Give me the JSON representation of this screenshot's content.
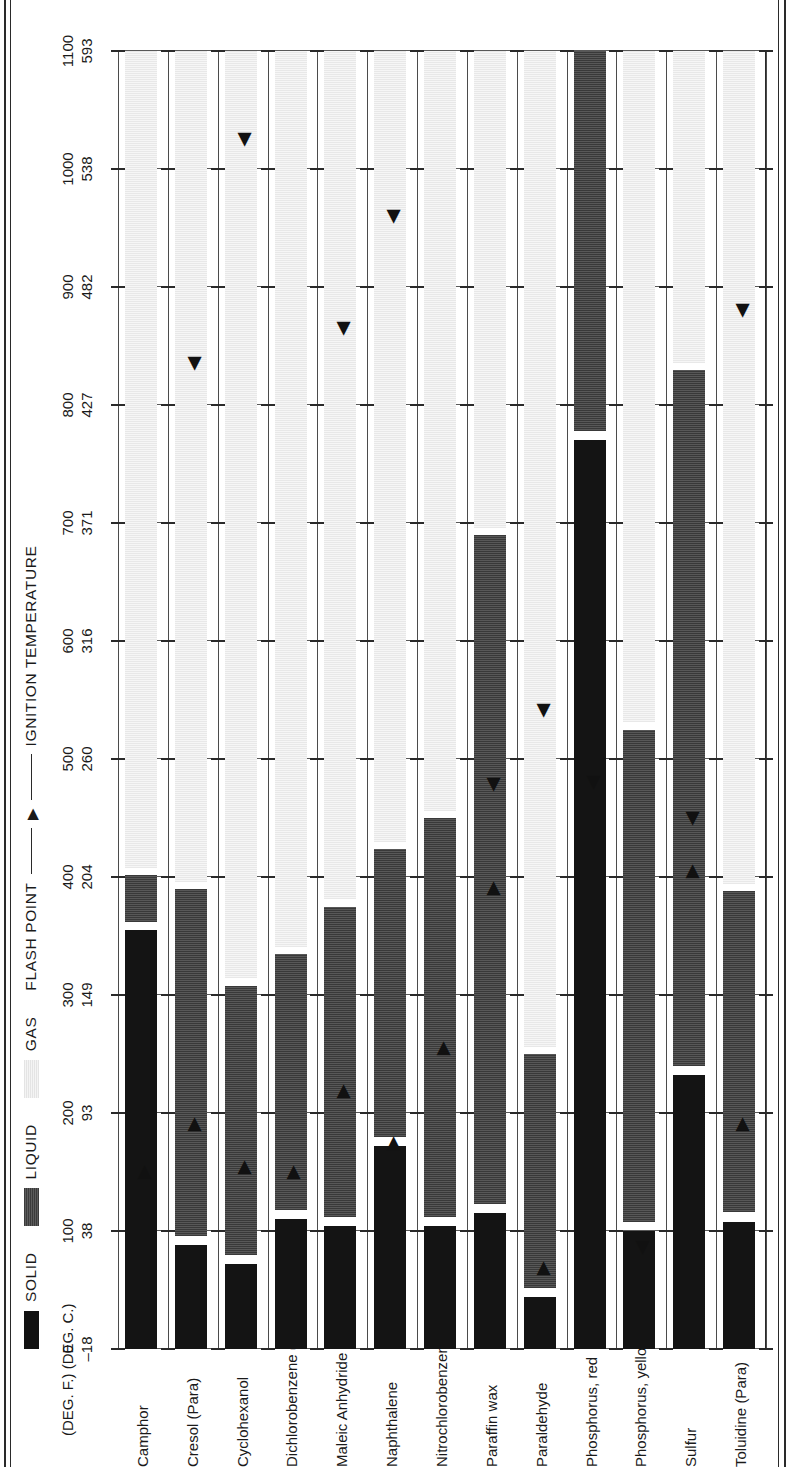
{
  "legend": {
    "items": [
      {
        "label": "SOLID",
        "swatch": "solid",
        "color": "#141414"
      },
      {
        "label": "LIQUID",
        "swatch": "liquid",
        "color": "#474747"
      },
      {
        "label": "GAS",
        "swatch": "gas",
        "color": "#efefef"
      }
    ],
    "flash_point_label": "FLASH POINT",
    "flash_point_marker": "▶",
    "ignition_label": "IGNITION TEMPERATURE",
    "ignition_marker": "◀"
  },
  "axis": {
    "unit_f": "(DEG. F.)",
    "unit_c": "(DEG. C.)",
    "ticks_f": [
      0,
      100,
      200,
      300,
      400,
      500,
      600,
      700,
      800,
      900,
      1000,
      1100
    ],
    "ticks_c": [
      -18,
      38,
      93,
      149,
      204,
      260,
      316,
      371,
      427,
      482,
      538,
      593
    ],
    "ticks_c_display": [
      "–18",
      "38",
      "93",
      "149",
      "204",
      "260",
      "316",
      "371",
      "427",
      "482",
      "538",
      "593"
    ],
    "min_f": 0,
    "max_f": 1100
  },
  "chart_data": {
    "type": "bar",
    "title": "",
    "xlabel": "",
    "ylabel": "",
    "xlim": [
      0,
      1100
    ],
    "grid": true,
    "legend_position": "top",
    "categories": [
      "Camphor",
      "Cresol (Para)",
      "Cyclohexanol",
      "Dichlorobenzene (Para)",
      "Maleic Anhydride",
      "Naphthalene",
      "Nitrochlorobenzene (Ortho)",
      "Paraffin wax",
      "Paraldehyde",
      "Phosphorus, red",
      "Phosphorus, yellow",
      "Sulfur",
      "Toluidine (Para)"
    ],
    "series": [
      {
        "name": "Camphor",
        "solid": [
          0,
          355
        ],
        "liquid": [
          362,
          402
        ],
        "gas": [
          408,
          1100
        ],
        "flash_point": 150,
        "ignition_temperature": null
      },
      {
        "name": "Cresol (Para)",
        "solid": [
          0,
          88
        ],
        "liquid": [
          96,
          390
        ],
        "gas": [
          396,
          1100
        ],
        "flash_point": 190,
        "ignition_temperature": 835
      },
      {
        "name": "Cyclohexanol",
        "solid": [
          0,
          72
        ],
        "liquid": [
          80,
          308
        ],
        "gas": [
          314,
          1100
        ],
        "flash_point": 154,
        "ignition_temperature": 1025
      },
      {
        "name": "Dichlorobenzene (Para)",
        "solid": [
          0,
          110
        ],
        "liquid": [
          118,
          335
        ],
        "gas": [
          341,
          1100
        ],
        "flash_point": 150,
        "ignition_temperature": null
      },
      {
        "name": "Maleic Anhydride",
        "solid": [
          0,
          104
        ],
        "liquid": [
          112,
          375
        ],
        "gas": [
          381,
          1100
        ],
        "flash_point": 218,
        "ignition_temperature": 865
      },
      {
        "name": "Naphthalene",
        "solid": [
          0,
          172
        ],
        "liquid": [
          180,
          424
        ],
        "gas": [
          430,
          1100
        ],
        "flash_point": 174,
        "ignition_temperature": 960
      },
      {
        "name": "Nitrochlorobenzene (Ortho)",
        "solid": [
          0,
          104
        ],
        "liquid": [
          112,
          450
        ],
        "gas": [
          456,
          1100
        ],
        "flash_point": 255,
        "ignition_temperature": null
      },
      {
        "name": "Paraffin wax",
        "solid": [
          0,
          115
        ],
        "liquid": [
          123,
          690
        ],
        "gas": [
          696,
          1100
        ],
        "flash_point": 390,
        "ignition_temperature": 478
      },
      {
        "name": "Paraldehyde",
        "solid": [
          0,
          44
        ],
        "liquid": [
          52,
          250
        ],
        "gas": [
          256,
          1100
        ],
        "flash_point": 68,
        "ignition_temperature": 541
      },
      {
        "name": "Phosphorus, red",
        "solid": [
          0,
          770
        ],
        "liquid": [
          778,
          1100
        ],
        "gas": null,
        "flash_point": null,
        "ignition_temperature": 480
      },
      {
        "name": "Phosphorus, yellow",
        "solid": [
          0,
          100
        ],
        "liquid": [
          108,
          525
        ],
        "gas": [
          531,
          1100
        ],
        "flash_point": null,
        "ignition_temperature": 86
      },
      {
        "name": "Sulfur",
        "solid": [
          0,
          232
        ],
        "liquid": [
          240,
          830
        ],
        "gas": [
          836,
          1100
        ],
        "flash_point": 405,
        "ignition_temperature": 450
      },
      {
        "name": "Toluidine (Para)",
        "solid": [
          0,
          108
        ],
        "liquid": [
          116,
          388
        ],
        "gas": [
          394,
          1100
        ],
        "flash_point": 190,
        "ignition_temperature": 880
      }
    ]
  }
}
